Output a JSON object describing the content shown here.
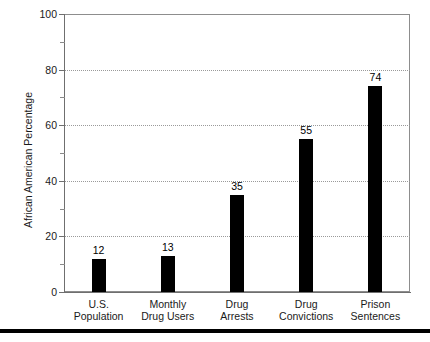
{
  "figure": {
    "title_fragment": "",
    "bottom_rule": "horizontal-rule"
  },
  "chart_data": {
    "type": "bar",
    "title": "",
    "xlabel": "",
    "ylabel": "African American Percentage",
    "categories": [
      "U.S. Population",
      "Monthly Drug Users",
      "Drug Arrests",
      "Drug Convictions",
      "Prison Sentences"
    ],
    "category_lines": [
      [
        "U.S.",
        "Population"
      ],
      [
        "Monthly",
        "Drug Users"
      ],
      [
        "Drug",
        "Arrests"
      ],
      [
        "Drug",
        "Convictions"
      ],
      [
        "Prison",
        "Sentences"
      ]
    ],
    "values": [
      12,
      13,
      35,
      55,
      74
    ],
    "value_labels": [
      "12",
      "13",
      "35",
      "55",
      "74"
    ],
    "ylim": [
      0,
      100
    ],
    "yticks": [
      0,
      20,
      40,
      60,
      80,
      100
    ],
    "ytick_labels": [
      "0",
      "20",
      "40",
      "60",
      "80",
      "100"
    ],
    "yminor_ticks": [
      10,
      30,
      50,
      70,
      90
    ],
    "grid": true,
    "grid_axis": "y",
    "legend": "none",
    "bar_color": "#000000",
    "grid_color": "#9a9a9a",
    "axis_color": "#6f6f6f",
    "background": "#ffffff"
  }
}
